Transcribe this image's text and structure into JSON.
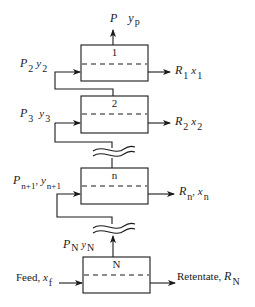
{
  "diagram": {
    "type": "multistage membrane cascade",
    "stages": [
      {
        "id": "1",
        "label": "1"
      },
      {
        "id": "2",
        "label": "2"
      },
      {
        "id": "n",
        "label": "n"
      },
      {
        "id": "N",
        "label": "N"
      }
    ],
    "streams": {
      "permeate_out": {
        "P": "P",
        "y": "y",
        "y_sub": "p"
      },
      "recycle_2": {
        "P": "P",
        "P_sub": "2",
        "y": "y",
        "y_sub": "2"
      },
      "recycle_3": {
        "P": "P",
        "P_sub": "3",
        "y": "y",
        "y_sub": "3"
      },
      "recycle_n1": {
        "P": "P",
        "P_sub": "n+1",
        "sep": ",",
        "y": "y",
        "y_sub": "n+1"
      },
      "permeate_N": {
        "P": "P",
        "P_sub": "N",
        "y": "y",
        "y_sub": "N"
      },
      "feed": {
        "text": "Feed, ",
        "x": "x",
        "x_sub": "f"
      },
      "retentate_1": {
        "R": "R",
        "R_sub": "1",
        "x": "x",
        "x_sub": "1"
      },
      "retentate_2": {
        "R": "R",
        "R_sub": "2",
        "x": "x",
        "x_sub": "2"
      },
      "retentate_n": {
        "R": "R",
        "R_sub": "n",
        "sep": ",",
        "x": "x",
        "x_sub": "n"
      },
      "retentate_N": {
        "text": "Retentate, ",
        "R": "R",
        "R_sub": "N"
      }
    },
    "colors": {
      "line": "#1a1a1a",
      "background": "#ffffff"
    }
  }
}
